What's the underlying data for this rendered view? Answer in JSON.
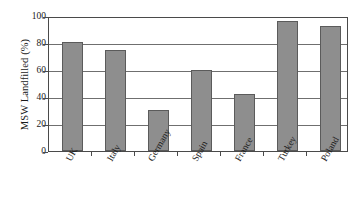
{
  "chart_data": {
    "type": "bar",
    "title": "",
    "xlabel": "",
    "ylabel": "MSW Landfilled (%)",
    "categories": [
      "UK",
      "Italy",
      "Germany",
      "Spain",
      "France",
      "Turkey",
      "Poland"
    ],
    "values": [
      82,
      76,
      31,
      61,
      43,
      98,
      94
    ],
    "ylim": [
      0,
      100
    ],
    "yticks": [
      0,
      20,
      40,
      60,
      80,
      100
    ],
    "ytick_labels": [
      "0",
      "20",
      "40",
      "60",
      "80",
      "100"
    ],
    "grid": true,
    "grid_axis": "y",
    "legend": false,
    "legend_position": "none",
    "bar_color": "#8e8e8e",
    "bar_edge_color": "#5b5b5b",
    "axis_color": "#4a4a4a",
    "background_color": "#ffffff",
    "xtick_label_rotation": -60
  }
}
